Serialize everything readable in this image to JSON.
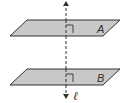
{
  "diagram": {
    "type": "geometry",
    "planes": [
      {
        "label": "A",
        "fill": "#c8c8c8",
        "stroke": "#333333"
      },
      {
        "label": "B",
        "fill": "#c8c8c8",
        "stroke": "#333333"
      }
    ],
    "line": {
      "label": "ℓ",
      "style": "dashed",
      "arrows": "both",
      "stroke": "#333333"
    },
    "right_angle_marks": 2
  }
}
